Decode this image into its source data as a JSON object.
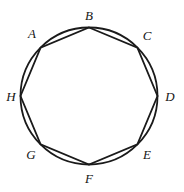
{
  "figure": {
    "kind": "geometry-diagram",
    "background_color": "#ffffff",
    "stroke_color": "#1a1a1a",
    "label_color": "#151515",
    "circle": {
      "cx": 89,
      "cy": 96,
      "r": 68.5,
      "stroke_width": 1.8
    },
    "polygon": {
      "sides": 8,
      "stroke_width": 1.8,
      "start_angle_deg": -90,
      "vertices": [
        {
          "id": "B",
          "label": "B",
          "angle_deg": -90,
          "x": 89.0,
          "y": 27.5,
          "label_x": 89.0,
          "label_y": 15.0
        },
        {
          "id": "C",
          "label": "C",
          "angle_deg": -45,
          "x": 137.4,
          "y": 47.6,
          "label_x": 147.0,
          "label_y": 35.0
        },
        {
          "id": "D",
          "label": "D",
          "angle_deg": 0,
          "x": 157.5,
          "y": 96.0,
          "label_x": 170.0,
          "label_y": 96.0
        },
        {
          "id": "E",
          "label": "E",
          "angle_deg": 45,
          "x": 137.4,
          "y": 144.4,
          "label_x": 147.0,
          "label_y": 154.0
        },
        {
          "id": "F",
          "label": "F",
          "angle_deg": 90,
          "x": 89.0,
          "y": 164.5,
          "label_x": 89.0,
          "label_y": 178.0
        },
        {
          "id": "G",
          "label": "G",
          "angle_deg": 135,
          "x": 40.6,
          "y": 144.4,
          "label_x": 31.0,
          "label_y": 154.0
        },
        {
          "id": "H",
          "label": "H",
          "angle_deg": 180,
          "x": 20.5,
          "y": 96.0,
          "label_x": 11.0,
          "label_y": 96.0
        },
        {
          "id": "A",
          "label": "A",
          "angle_deg": -135,
          "x": 40.6,
          "y": 47.6,
          "label_x": 32.0,
          "label_y": 33.0
        }
      ]
    }
  }
}
